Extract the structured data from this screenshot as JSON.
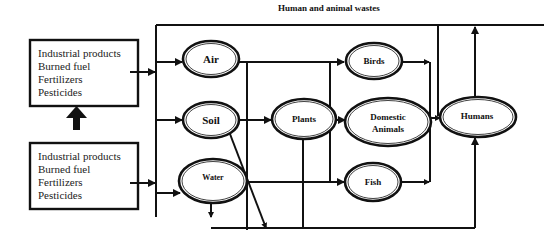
{
  "diagram": {
    "title": "Human and animal wastes",
    "sources": {
      "top_box": {
        "lines": [
          "Industrial products",
          "Burned fuel",
          "Fertilizers",
          "Pesticides"
        ]
      },
      "bottom_box": {
        "lines": [
          "Industrial products",
          "Burned fuel",
          "Fertilizers",
          "Pesticides"
        ]
      }
    },
    "nodes": {
      "air": "Air",
      "soil": "Soil",
      "water": "Water",
      "plants": "Plants",
      "birds": "Birds",
      "domestic_1": "Domestic",
      "domestic_2": "Animals",
      "fish": "Fish",
      "humans": "Humans"
    },
    "edges": [
      {
        "from": "bottom_box",
        "to": "top_box"
      },
      {
        "from": "top_box",
        "to": "air"
      },
      {
        "from": "bottom_box",
        "to": "water"
      },
      {
        "from": "sources",
        "to": "soil"
      },
      {
        "from": "air",
        "to": "birds"
      },
      {
        "from": "soil",
        "to": "plants"
      },
      {
        "from": "water",
        "to": "fish"
      },
      {
        "from": "plants",
        "to": "domestic_animals"
      },
      {
        "from": "birds",
        "to": "humans"
      },
      {
        "from": "domestic_animals",
        "to": "humans"
      },
      {
        "from": "fish",
        "to": "humans"
      },
      {
        "from": "humans",
        "to": "environment",
        "label": "Human and animal wastes"
      }
    ]
  }
}
